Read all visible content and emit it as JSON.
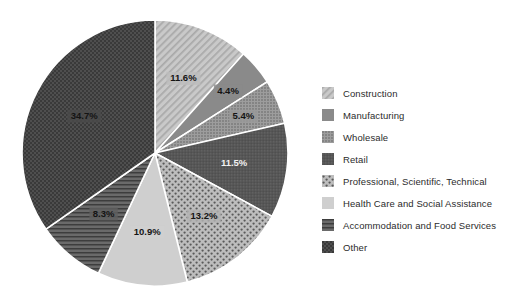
{
  "chart_data": {
    "type": "pie",
    "title": "",
    "subtitle": "",
    "xlabel": "",
    "ylabel": "",
    "legend_position": "right",
    "grid": false,
    "start_angle_deg": 0,
    "direction": "clockwise",
    "categories": [
      "Construction",
      "Manufacturing",
      "Wholesale",
      "Retail",
      "Professional, Scientific, Technical",
      "Health Care and Social Assistance",
      "Accommodation and Food Services",
      "Other"
    ],
    "values": [
      11.6,
      4.4,
      5.4,
      11.5,
      13.2,
      10.9,
      8.3,
      34.7
    ],
    "value_labels": [
      "11.6%",
      "4.4%",
      "5.4%",
      "11.5%",
      "13.2%",
      "10.9%",
      "8.3%",
      "34.7%"
    ],
    "slices": [
      {
        "label": "Construction",
        "value": 11.6,
        "value_label": "11.6%",
        "color": "#bdbdbd",
        "pattern": "diagonal-hatch",
        "label_color": "dark"
      },
      {
        "label": "Manufacturing",
        "value": 4.4,
        "value_label": "4.4%",
        "color": "#8a8a8a",
        "pattern": "solid",
        "label_color": "dark"
      },
      {
        "label": "Wholesale",
        "value": 5.4,
        "value_label": "5.4%",
        "color": "#9a9a9a",
        "pattern": "fine-dots",
        "label_color": "dark"
      },
      {
        "label": "Retail",
        "value": 11.5,
        "value_label": "11.5%",
        "color": "#565656",
        "pattern": "dense-speckle",
        "label_color": "light"
      },
      {
        "label": "Professional, Scientific, Technical",
        "value": 13.2,
        "value_label": "13.2%",
        "color": "#b2b2b2",
        "pattern": "polka-dots",
        "label_color": "dark"
      },
      {
        "label": "Health Care and Social Assistance",
        "value": 10.9,
        "value_label": "10.9%",
        "color": "#cfcfcf",
        "pattern": "solid",
        "label_color": "dark"
      },
      {
        "label": "Accommodation and Food Services",
        "value": 8.3,
        "value_label": "8.3%",
        "color": "#5f5f5f",
        "pattern": "horizontal-lines",
        "label_color": "dark"
      },
      {
        "label": "Other",
        "value": 34.7,
        "value_label": "34.7%",
        "color": "#4a4a4a",
        "pattern": "checkerboard",
        "label_color": "dark"
      }
    ]
  },
  "legend": {
    "items": [
      {
        "label": "Construction"
      },
      {
        "label": "Manufacturing"
      },
      {
        "label": "Wholesale"
      },
      {
        "label": "Retail"
      },
      {
        "label": "Professional, Scientific, Technical"
      },
      {
        "label": "Health Care and Social Assistance"
      },
      {
        "label": "Accommodation and Food Services"
      },
      {
        "label": "Other"
      }
    ]
  },
  "colors": {
    "background": "#ffffff",
    "text": "#2b2b2b",
    "separator": "#ffffff"
  }
}
